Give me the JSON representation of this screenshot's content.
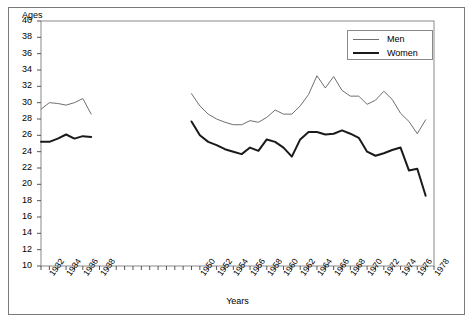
{
  "chart_data": {
    "type": "line",
    "title": "",
    "xlabel": "Years",
    "ylabel": "Ages",
    "xlim": [
      1931,
      1978
    ],
    "ylim": [
      10,
      40
    ],
    "grid": false,
    "legend_position": "top-right",
    "ytick_labels": [
      "40",
      "38",
      "36",
      "34",
      "32",
      "30",
      "28",
      "26",
      "24",
      "22",
      "20",
      "18",
      "16",
      "14",
      "12",
      "10"
    ],
    "ytick_values": [
      40,
      38,
      36,
      34,
      32,
      30,
      28,
      26,
      24,
      22,
      20,
      18,
      16,
      14,
      12,
      10
    ],
    "xtick_labels": [
      "1932",
      "1934",
      "1936",
      "1938",
      "1950",
      "1952",
      "1954",
      "1956",
      "1958",
      "1960",
      "1962",
      "1964",
      "1966",
      "1968",
      "1970",
      "1972",
      "1974",
      "1976",
      "1978"
    ],
    "xtick_values": [
      1932,
      1934,
      1936,
      1938,
      1950,
      1952,
      1954,
      1956,
      1958,
      1960,
      1962,
      1964,
      1966,
      1968,
      1970,
      1972,
      1974,
      1976,
      1978
    ],
    "series": [
      {
        "name": "Men",
        "color": "#6f6f6f",
        "width": 1,
        "segments": [
          {
            "x": [
              1931,
              1932,
              1933,
              1934,
              1935,
              1936,
              1937
            ],
            "values": [
              29.2,
              30.0,
              29.9,
              29.7,
              30.0,
              30.5,
              28.6
            ]
          },
          {
            "x": [
              1949,
              1950,
              1951,
              1952,
              1953,
              1954,
              1955,
              1956,
              1957,
              1958,
              1959,
              1960,
              1961,
              1962,
              1963,
              1964,
              1965,
              1966,
              1967,
              1968,
              1969,
              1970,
              1971,
              1972,
              1973,
              1974,
              1975,
              1976,
              1977
            ],
            "values": [
              31.1,
              29.6,
              28.6,
              28.0,
              27.6,
              27.3,
              27.3,
              27.8,
              27.6,
              28.2,
              29.1,
              28.6,
              28.6,
              29.6,
              31.0,
              33.3,
              31.8,
              33.2,
              31.5,
              30.8,
              30.8,
              29.8,
              30.3,
              31.4,
              30.4,
              28.7,
              27.7,
              26.2,
              27.9
            ]
          }
        ]
      },
      {
        "name": "Women",
        "color": "#1a1a1a",
        "width": 2,
        "segments": [
          {
            "x": [
              1931,
              1932,
              1933,
              1934,
              1935,
              1936,
              1937
            ],
            "values": [
              25.2,
              25.2,
              25.6,
              26.1,
              25.6,
              25.9,
              25.8
            ]
          },
          {
            "x": [
              1949,
              1950,
              1951,
              1952,
              1953,
              1954,
              1955,
              1956,
              1957,
              1958,
              1959,
              1960,
              1961,
              1962,
              1963,
              1964,
              1965,
              1966,
              1967,
              1968,
              1969,
              1970,
              1971,
              1972,
              1973,
              1974,
              1975,
              1976,
              1977
            ],
            "values": [
              27.7,
              26.0,
              25.2,
              24.8,
              24.3,
              24.0,
              23.7,
              24.5,
              24.1,
              25.5,
              25.2,
              24.5,
              23.4,
              25.5,
              26.4,
              26.4,
              26.1,
              26.2,
              26.6,
              26.2,
              25.7,
              24.0,
              23.5,
              23.8,
              24.2,
              24.5,
              21.7,
              21.9,
              18.6
            ]
          }
        ]
      }
    ]
  },
  "legend": {
    "entries": [
      {
        "label": "Men"
      },
      {
        "label": "Women"
      }
    ]
  }
}
